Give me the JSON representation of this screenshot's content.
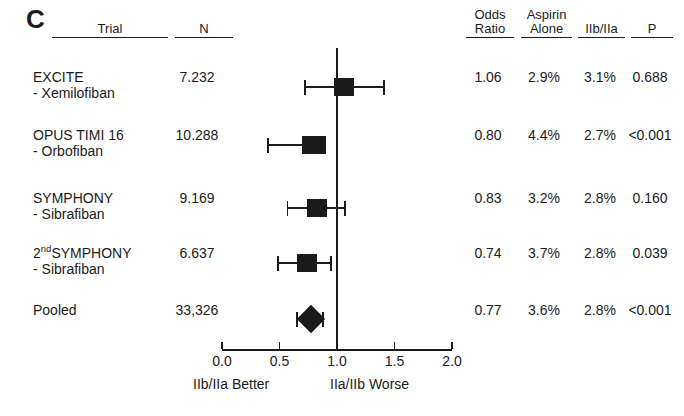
{
  "panel": {
    "letter": "C"
  },
  "headers": {
    "trial": "Trial",
    "n": "N",
    "odds_ratio": "Odds\nRatio",
    "aspirin_alone": "Aspirin\nAlone",
    "iibiiia": "IIb/IIa",
    "p": "P"
  },
  "axis": {
    "ticks": [
      "0.0",
      "0.5",
      "1.0",
      "1.5",
      "2.0"
    ],
    "tick_values": [
      0.0,
      0.5,
      1.0,
      1.5,
      2.0
    ],
    "xmin": 0.0,
    "xmax": 2.0,
    "reference_line": 1.0,
    "left_caption": "IIb/IIa Better",
    "right_caption": "IIa/IIb Worse"
  },
  "chart_data": {
    "type": "forest",
    "title": "C",
    "xlabel": "Odds Ratio",
    "ylabel": "",
    "xlim": [
      0.0,
      2.0
    ],
    "grid": false,
    "legend": "none",
    "reference_line": 1.0,
    "left_caption": "IIb/IIa Better",
    "right_caption": "IIa/IIb Worse",
    "columns": [
      "Trial",
      "N",
      "Odds Ratio",
      "Aspirin Alone",
      "IIb/IIa",
      "P"
    ],
    "rows": [
      {
        "trial": "EXCITE",
        "drug": "- Xemilofiban",
        "n": "7.232",
        "odds_ratio": "1.06",
        "or_value": 1.06,
        "ci_low": 0.72,
        "ci_high": 1.41,
        "aspirin_alone": "2.9%",
        "iibiiia": "3.1%",
        "p": "0.688",
        "marker": "square"
      },
      {
        "trial": "OPUS TIMI 16",
        "drug": "- Orbofiban",
        "n": "10.288",
        "odds_ratio": "0.80",
        "or_value": 0.8,
        "ci_low": 0.4,
        "ci_high": 0.7,
        "aspirin_alone": "4.4%",
        "iibiiia": "2.7%",
        "p": "<0.001",
        "marker": "square"
      },
      {
        "trial": "SYMPHONY",
        "drug": "- Sibrafiban",
        "n": "9.169",
        "odds_ratio": "0.83",
        "or_value": 0.83,
        "ci_low": 0.57,
        "ci_high": 1.07,
        "aspirin_alone": "3.2%",
        "iibiiia": "2.8%",
        "p": "0.160",
        "marker": "square"
      },
      {
        "trial": "2ndSYMPHONY",
        "trial_prefix": "2",
        "trial_sup": "nd",
        "trial_rest": "SYMPHONY",
        "drug": "- Sibrafiban",
        "n": "6.637",
        "odds_ratio": "0.74",
        "or_value": 0.74,
        "ci_low": 0.49,
        "ci_high": 0.95,
        "aspirin_alone": "3.7%",
        "iibiiia": "2.8%",
        "p": "0.039",
        "marker": "square"
      },
      {
        "trial": "Pooled",
        "drug": "",
        "n": "33,326",
        "odds_ratio": "0.77",
        "or_value": 0.77,
        "ci_low": 0.65,
        "ci_high": 0.88,
        "aspirin_alone": "3.6%",
        "iibiiia": "2.8%",
        "p": "<0.001",
        "marker": "diamond"
      }
    ]
  },
  "colors": {
    "ink": "#1a1a1a",
    "background": "#ffffff"
  }
}
